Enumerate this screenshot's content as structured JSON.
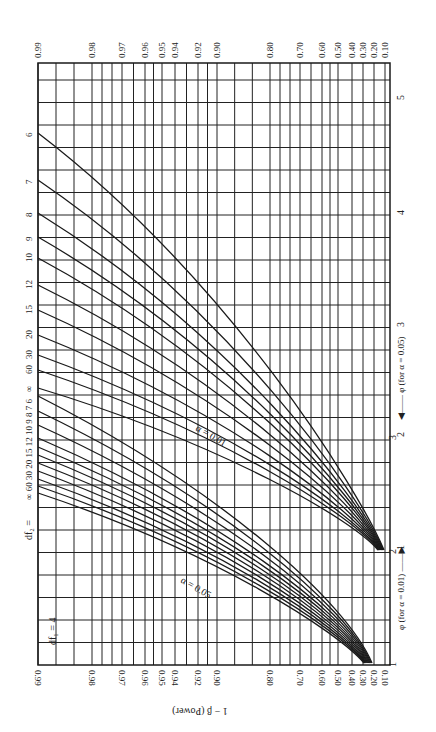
{
  "chart_data": {
    "type": "line",
    "orientation": "rotated-90",
    "df1_label": "df₁ = 4",
    "df2_label": "df₂ =",
    "xlabel": "1 − β  (Power)",
    "ylabel_alpha01": "φ (for α = 0.01) ——▶",
    "ylabel_alpha05": "◀—— φ (for α = 0.05)",
    "alpha_labels": [
      "α = 0.01",
      "α = 0.05"
    ],
    "power_ticks": [
      "0.99",
      "0.98",
      "0.97",
      "0.96",
      "0.95",
      "0.94",
      "0.92",
      "0.90",
      "0.80",
      "0.70",
      "0.60",
      "0.50",
      "0.40",
      "0.30",
      "0.20",
      "0.10"
    ],
    "power_tick_pos": [
      38,
      92,
      122,
      145,
      162,
      175,
      198,
      217,
      270,
      300,
      322,
      338,
      352,
      363,
      374,
      385
    ],
    "phi_ticks_alpha05": [
      {
        "label": "1",
        "y": 550
      },
      {
        "label": "2",
        "y": 437
      },
      {
        "label": "3",
        "y": 327
      },
      {
        "label": "4",
        "y": 215
      },
      {
        "label": "5",
        "y": 100
      }
    ],
    "phi_ticks_alpha01": [
      {
        "label": "1",
        "y": 663
      },
      {
        "label": "2",
        "y": 550
      },
      {
        "label": "3",
        "y": 436
      }
    ],
    "df2_values": [
      "6",
      "7",
      "8",
      "9",
      "10",
      "12",
      "15",
      "20",
      "30",
      "60",
      "∞"
    ],
    "series": [
      {
        "name": "alpha=0.01, df2=6",
        "start_y": 133
      },
      {
        "name": "alpha=0.01, df2=7",
        "start_y": 180
      },
      {
        "name": "alpha=0.01, df2=8",
        "start_y": 213
      },
      {
        "name": "alpha=0.01, df2=9",
        "start_y": 237
      },
      {
        "name": "alpha=0.01, df2=10",
        "start_y": 258
      },
      {
        "name": "alpha=0.01, df2=12",
        "start_y": 285
      },
      {
        "name": "alpha=0.01, df2=15",
        "start_y": 310
      },
      {
        "name": "alpha=0.01, df2=20",
        "start_y": 335
      },
      {
        "name": "alpha=0.01, df2=30",
        "start_y": 355
      },
      {
        "name": "alpha=0.01, df2=60",
        "start_y": 370
      },
      {
        "name": "alpha=0.01, df2=∞",
        "start_y": 388
      },
      {
        "name": "alpha=0.05, df2=6",
        "start_y": 396
      },
      {
        "name": "alpha=0.05, df2=7",
        "start_y": 411
      },
      {
        "name": "alpha=0.05, df2=8",
        "start_y": 425
      },
      {
        "name": "alpha=0.05, df2=9",
        "start_y": 438
      },
      {
        "name": "alpha=0.05, df2=10",
        "start_y": 447
      },
      {
        "name": "alpha=0.05, df2=12",
        "start_y": 455
      },
      {
        "name": "alpha=0.05, df2=15",
        "start_y": 463
      },
      {
        "name": "alpha=0.05, df2=20",
        "start_y": 471
      },
      {
        "name": "alpha=0.05, df2=30",
        "start_y": 479
      },
      {
        "name": "alpha=0.05, df2=60",
        "start_y": 486
      },
      {
        "name": "alpha=0.05, df2=∞",
        "start_y": 493
      }
    ],
    "grid": true
  }
}
